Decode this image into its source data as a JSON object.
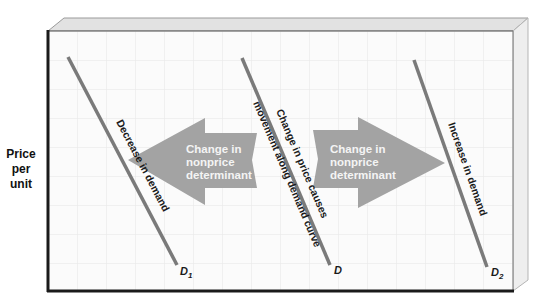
{
  "diagram": {
    "title": "",
    "y_axis_label": [
      "Price",
      "per",
      "unit"
    ],
    "x_axis_label": "",
    "curves": [
      {
        "id": "D1",
        "label_main": "D",
        "label_sub": "1",
        "annotation": "Decrease in demand",
        "x1": 68,
        "y1": 57,
        "x2": 177,
        "y2": 265
      },
      {
        "id": "D",
        "label_main": "D",
        "label_sub": "",
        "annotation_line1": "Change in price causes",
        "annotation_line2": "movement along demand curve",
        "x1": 242,
        "y1": 58,
        "x2": 330,
        "y2": 265
      },
      {
        "id": "D2",
        "label_main": "D",
        "label_sub": "2",
        "annotation": "Increase in demand",
        "x1": 414,
        "y1": 60,
        "x2": 487,
        "y2": 267
      }
    ],
    "arrows": [
      {
        "id": "left-arrow",
        "direction": "left",
        "text": [
          "Change in",
          "nonprice",
          "determinant"
        ]
      },
      {
        "id": "right-arrow",
        "direction": "right",
        "text": [
          "Change in",
          "nonprice",
          "determinant"
        ]
      }
    ],
    "colors": {
      "curve": "#7a7a7a",
      "arrow_fill": "#a3a3a3",
      "arrow_text": "#f2f2f2",
      "grid": "#e6e6e6",
      "frame": "#1a1a1a",
      "bevel_top": "#e0e0e0",
      "bevel_side": "#eeeeee",
      "face": "#fbfbfb"
    }
  }
}
